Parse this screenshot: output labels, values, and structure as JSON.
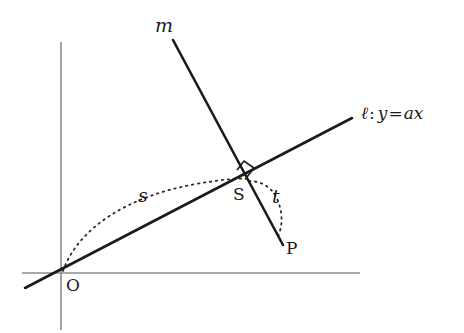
{
  "figure": {
    "width": 464,
    "height": 333,
    "background": "#ffffff"
  },
  "colors": {
    "axis": "#8c8c8c",
    "line": "#1a1a1a",
    "dotted": "#2b2b2b",
    "text": "#1a1a1a"
  },
  "axes": {
    "x_axis": {
      "x1": 22,
      "y1": 273,
      "x2": 360,
      "y2": 273,
      "stroke_width": 1.6
    },
    "y_axis": {
      "x1": 61,
      "y1": 42,
      "x2": 61,
      "y2": 330,
      "stroke_width": 1.6
    }
  },
  "lines": [
    {
      "id": "line-l",
      "label": "ℓ",
      "equation": "y = ax",
      "x1": 25,
      "y1": 288,
      "x2": 352,
      "y2": 118,
      "stroke_width": 2.6
    },
    {
      "id": "line-m",
      "label": "m",
      "x1": 173,
      "y1": 40,
      "x2": 283,
      "y2": 245,
      "stroke_width": 2.6
    }
  ],
  "points": [
    {
      "id": "point-O",
      "label": "O",
      "x": 61,
      "y": 273
    },
    {
      "id": "point-S",
      "label": "S",
      "x": 247,
      "y": 180
    },
    {
      "id": "point-P",
      "label": "P",
      "x": 283,
      "y": 245
    }
  ],
  "arcs": [
    {
      "id": "arc-s",
      "label": "s",
      "path": "M 63 271 C 78 228, 128 196, 196 184 C 225 179, 240 178, 246 179",
      "dash": "1.5 4.5",
      "stroke_width": 1.8
    },
    {
      "id": "arc-t",
      "label": "t",
      "path": "M 249 181 C 264 181, 275 190, 279 204 C 283 216, 282 228, 278 236",
      "dash": "1.5 4.5",
      "stroke_width": 1.8
    }
  ],
  "right_angle": {
    "id": "right-angle-mark",
    "path": "M 237 170 L 244 161 L 254 168 L 247 177",
    "stroke_width": 1.6
  },
  "labels": {
    "line_m": "m",
    "line_l_symbol": "ℓ",
    "line_l_colon": ":",
    "line_l_y": "y",
    "line_l_equals": "=",
    "line_l_a": "a",
    "line_l_x": "x",
    "arc_s": "s",
    "arc_t": "t",
    "point_S": "S",
    "point_P": "P",
    "point_O": "O"
  }
}
